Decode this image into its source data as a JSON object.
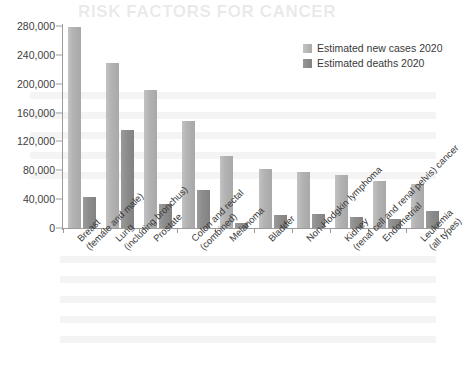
{
  "chart_data": {
    "type": "bar",
    "title": "",
    "xlabel": "",
    "ylabel": "",
    "ylim": [
      0,
      280000
    ],
    "grid": false,
    "legend_position": "top-right",
    "y_ticks": [
      "0",
      "40,000",
      "80,000",
      "120,000",
      "160,000",
      "200,000",
      "240,000",
      "280,000"
    ],
    "y_tick_values": [
      0,
      40000,
      80000,
      120000,
      160000,
      200000,
      240000,
      280000
    ],
    "categories": [
      "Breast (female and male)",
      "Lung (including bronchus)",
      "Prostate",
      "Colon and rectal (combined)",
      "Melanoma",
      "Bladder",
      "Non-Hodgkin lymphoma",
      "Kidney (renal cell and renal pelvis) cancer",
      "Endometrial",
      "Leukemia (all types)"
    ],
    "category_lines": [
      [
        "Breast",
        "(female and male)"
      ],
      [
        "Lung",
        "(including bronchus)"
      ],
      [
        "Prostate",
        ""
      ],
      [
        "Colon and rectal",
        "(combined)"
      ],
      [
        "Melanoma",
        ""
      ],
      [
        "Bladder",
        ""
      ],
      [
        "Non-Hodgkin lymphoma",
        ""
      ],
      [
        "Kidney",
        "(renal cell and renal pelvis) cancer"
      ],
      [
        "Endometrial",
        ""
      ],
      [
        "Leukemia",
        "(all types)"
      ]
    ],
    "series": [
      {
        "name": "Estimated new cases 2020",
        "color": "#b3b3b3",
        "values": [
          279100,
          228820,
          191930,
          147950,
          100350,
          81400,
          77240,
          73750,
          65620,
          60530
        ]
      },
      {
        "name": "Estimated deaths 2020",
        "color": "#8a8a8a",
        "values": [
          42690,
          135720,
          33330,
          53200,
          6850,
          17980,
          19940,
          14830,
          12590,
          23100
        ]
      }
    ]
  },
  "legend": {
    "items": [
      {
        "label": "Estimated new cases 2020"
      },
      {
        "label": "Estimated deaths 2020"
      }
    ]
  },
  "background": {
    "ghost_title": "RISK FACTORS FOR CANCER"
  }
}
